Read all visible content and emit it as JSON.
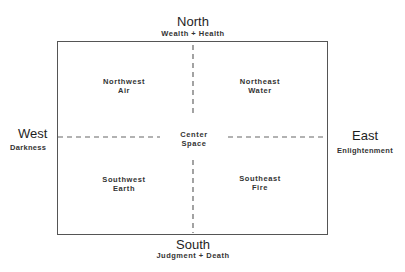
{
  "directions": {
    "north": {
      "label": "North",
      "meaning": "Wealth + Health"
    },
    "south": {
      "label": "South",
      "meaning": "Judgment + Death"
    },
    "west": {
      "label": "West",
      "meaning": "Darkness"
    },
    "east": {
      "label": "East",
      "meaning": "Enlightenment"
    }
  },
  "quadrants": {
    "northwest": {
      "label": "Northwest",
      "element": "Air"
    },
    "northeast": {
      "label": "Northeast",
      "element": "Water"
    },
    "southwest": {
      "label": "Southwest",
      "element": "Earth"
    },
    "southeast": {
      "label": "Southeast",
      "element": "Fire"
    },
    "center": {
      "label": "Center",
      "element": "Space"
    }
  },
  "colors": {
    "line": "#555555",
    "text": "#222222",
    "background": "#ffffff"
  }
}
